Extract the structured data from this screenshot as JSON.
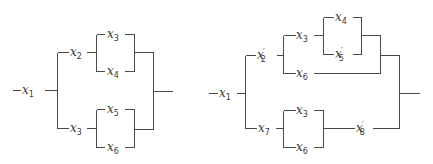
{
  "diagrams": [
    {
      "name": "left-series-parallel-network",
      "wires": [
        [
          12,
          90,
          20,
          90
        ],
        [
          44,
          90,
          57,
          90
        ],
        [
          57,
          52,
          57,
          128
        ],
        [
          57,
          52,
          68,
          52
        ],
        [
          86,
          52,
          96,
          52
        ],
        [
          96,
          34,
          96,
          71
        ],
        [
          96,
          34,
          104,
          34
        ],
        [
          124,
          34,
          134,
          34
        ],
        [
          96,
          71,
          104,
          71
        ],
        [
          124,
          71,
          134,
          71
        ],
        [
          134,
          34,
          134,
          71
        ],
        [
          134,
          52,
          153,
          52
        ],
        [
          57,
          128,
          68,
          128
        ],
        [
          86,
          128,
          96,
          128
        ],
        [
          96,
          109,
          96,
          147
        ],
        [
          96,
          109,
          104,
          109
        ],
        [
          124,
          109,
          134,
          109
        ],
        [
          96,
          147,
          104,
          147
        ],
        [
          124,
          147,
          134,
          147
        ],
        [
          134,
          109,
          134,
          147
        ],
        [
          134,
          129,
          153,
          129
        ],
        [
          153,
          52,
          153,
          129
        ],
        [
          153,
          91,
          172,
          91
        ]
      ],
      "labels": [
        {
          "id": "x1",
          "base": "x",
          "sub": "1",
          "prime": false,
          "x": 22,
          "y": 94
        },
        {
          "id": "x2",
          "base": "x",
          "sub": "2",
          "prime": false,
          "x": 70,
          "y": 56
        },
        {
          "id": "x3-top",
          "base": "x",
          "sub": "3",
          "prime": false,
          "x": 107,
          "y": 38
        },
        {
          "id": "x4",
          "base": "x",
          "sub": "4",
          "prime": false,
          "x": 107,
          "y": 75
        },
        {
          "id": "x3-bottom",
          "base": "x",
          "sub": "3",
          "prime": false,
          "x": 70,
          "y": 132
        },
        {
          "id": "x5",
          "base": "x",
          "sub": "5",
          "prime": false,
          "x": 107,
          "y": 113
        },
        {
          "id": "x6",
          "base": "x",
          "sub": "6",
          "prime": false,
          "x": 107,
          "y": 151
        }
      ]
    },
    {
      "name": "right-series-parallel-network",
      "wires": [
        [
          208,
          93,
          217,
          93
        ],
        [
          236,
          93,
          245,
          93
        ],
        [
          245,
          55,
          245,
          128
        ],
        [
          245,
          55,
          255,
          55
        ],
        [
          276,
          55,
          283,
          55
        ],
        [
          283,
          35,
          283,
          73
        ],
        [
          283,
          35,
          295,
          35
        ],
        [
          313,
          35,
          323,
          35
        ],
        [
          323,
          17,
          323,
          54
        ],
        [
          323,
          17,
          333,
          17
        ],
        [
          352,
          17,
          361,
          17
        ],
        [
          323,
          54,
          333,
          54
        ],
        [
          352,
          54,
          361,
          54
        ],
        [
          361,
          17,
          361,
          54
        ],
        [
          361,
          35,
          380,
          35
        ],
        [
          283,
          73,
          295,
          73
        ],
        [
          313,
          73,
          380,
          73
        ],
        [
          380,
          35,
          380,
          73
        ],
        [
          380,
          55,
          399,
          55
        ],
        [
          245,
          128,
          256,
          128
        ],
        [
          275,
          128,
          283,
          128
        ],
        [
          283,
          110,
          283,
          147
        ],
        [
          283,
          110,
          295,
          110
        ],
        [
          313,
          110,
          323,
          110
        ],
        [
          283,
          147,
          295,
          147
        ],
        [
          313,
          147,
          323,
          147
        ],
        [
          323,
          110,
          323,
          147
        ],
        [
          323,
          128,
          354,
          128
        ],
        [
          372,
          128,
          399,
          128
        ],
        [
          399,
          55,
          399,
          128
        ],
        [
          399,
          93,
          419,
          93
        ]
      ],
      "labels": [
        {
          "id": "x1",
          "base": "x",
          "sub": "1",
          "prime": false,
          "x": 219,
          "y": 97
        },
        {
          "id": "x2-prime",
          "base": "x",
          "sub": "2",
          "prime": true,
          "x": 257,
          "y": 59
        },
        {
          "id": "x3-top",
          "base": "x",
          "sub": "3",
          "prime": false,
          "x": 296,
          "y": 39
        },
        {
          "id": "x4",
          "base": "x",
          "sub": "4",
          "prime": false,
          "x": 335,
          "y": 21
        },
        {
          "id": "x5-prime",
          "base": "x",
          "sub": "5",
          "prime": true,
          "x": 335,
          "y": 58
        },
        {
          "id": "x6-top",
          "base": "x",
          "sub": "6",
          "prime": false,
          "x": 296,
          "y": 77
        },
        {
          "id": "x7",
          "base": "x",
          "sub": "7",
          "prime": false,
          "x": 258,
          "y": 132
        },
        {
          "id": "x3-bottom",
          "base": "x",
          "sub": "3",
          "prime": false,
          "x": 296,
          "y": 114
        },
        {
          "id": "x6-bottom",
          "base": "x",
          "sub": "6",
          "prime": false,
          "x": 296,
          "y": 151
        },
        {
          "id": "x8-prime",
          "base": "x",
          "sub": "8",
          "prime": true,
          "x": 356,
          "y": 132
        }
      ]
    }
  ]
}
